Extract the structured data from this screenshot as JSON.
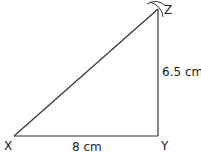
{
  "diagram": {
    "type": "triangle construction",
    "vertices": {
      "X": "X",
      "Y": "Y",
      "Z": "Z"
    },
    "sides": {
      "XY": "8 cm",
      "YZ": "6.5 cm"
    },
    "right_angle_at": "Y",
    "construction_arcs_at": "Z",
    "line_color": "#333333"
  }
}
